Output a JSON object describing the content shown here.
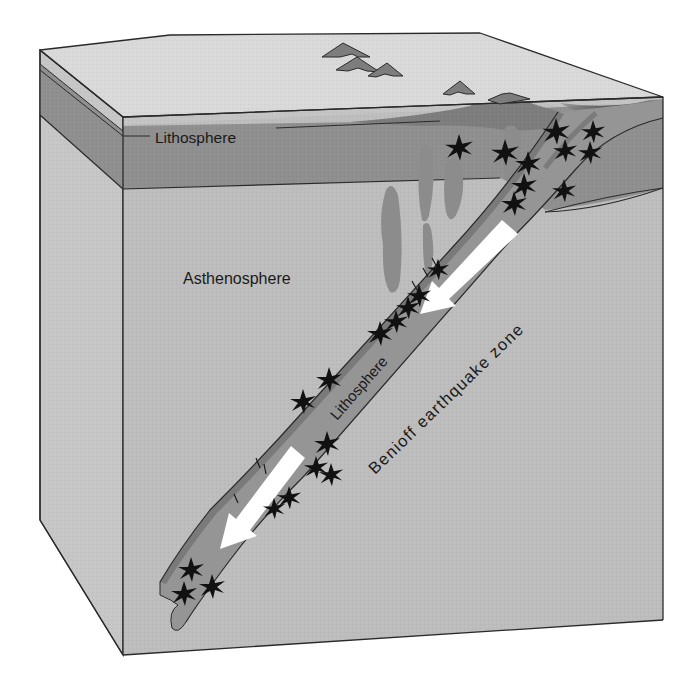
{
  "figure": {
    "type": "block-diagram"
  },
  "labels": {
    "lithosphere_top": "Lithosphere",
    "asthenosphere": "Asthenosphere",
    "lithosphere_slab": "Lithosphere",
    "benioff_zone": "Benioff earthquake zone"
  },
  "colors": {
    "background": "#ffffff",
    "surface_top": "#d9d9d9",
    "crust_strip": "#c4c4c4",
    "lithosphere_band": "#8f8f8f",
    "asthenosphere": "#bdbdbd",
    "left_face": "#c6c6c6",
    "slab": "#959595",
    "slab_top_edge": "#7a7a7a",
    "magma": "#8c8c8c",
    "volcano": "#7d7d7d",
    "earthquake_star": "#111111",
    "arrow": "#ffffff",
    "outline": "#2a2a2a"
  },
  "icons": {
    "earthquake": "earthquake-star-icon",
    "motion_arrow": "arrow-down-left-icon",
    "volcano": "volcano-icon"
  }
}
